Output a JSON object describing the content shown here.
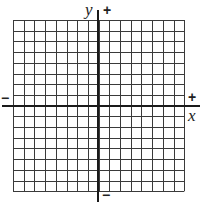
{
  "diagram": {
    "type": "coordinate-plane",
    "grid": {
      "columns": 16,
      "rows": 16,
      "left": 13,
      "top": 20,
      "cell": 10.7,
      "line_color": "#3a3a3a",
      "line_width": 1
    },
    "axes": {
      "color": "#1a1a1a",
      "width": 2,
      "x_axis": {
        "y": 106,
        "x_start": 2,
        "x_end": 200
      },
      "y_axis": {
        "x": 98,
        "y_start": 10,
        "y_end": 202
      }
    },
    "labels": {
      "y_axis_name": "y",
      "x_axis_name": "x",
      "y_positive": "+",
      "y_negative": "−",
      "x_positive": "+",
      "x_negative": "−"
    }
  }
}
